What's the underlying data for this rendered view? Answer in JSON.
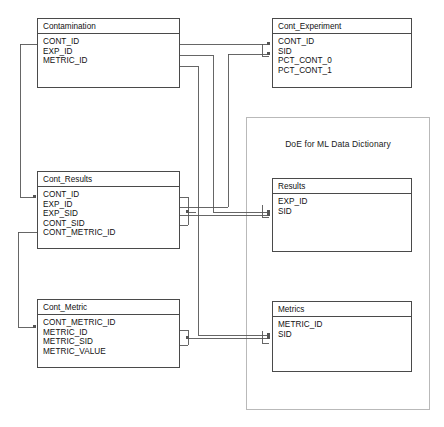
{
  "diagram": {
    "background_color": "#ffffff",
    "line_color": "#555555",
    "entity_border_color": "#4a4a4a",
    "group_border_color": "#b9b9b9"
  },
  "group": {
    "label": "DoE for ML Data Dictionary"
  },
  "entities": [
    {
      "key": "contamination",
      "name": "Contamination",
      "attributes": [
        "CONT_ID",
        "EXP_ID",
        "METRIC_ID"
      ]
    },
    {
      "key": "cont_experiment",
      "name": "Cont_Experiment",
      "attributes": [
        "CONT_ID",
        "SID",
        "PCT_CONT_0",
        "PCT_CONT_1"
      ]
    },
    {
      "key": "cont_results",
      "name": "Cont_Results",
      "attributes": [
        "CONT_ID",
        "EXP_ID",
        "EXP_SID",
        "CONT_SID",
        "CONT_METRIC_ID"
      ]
    },
    {
      "key": "results",
      "name": "Results",
      "attributes": [
        "EXP_ID",
        "SID"
      ]
    },
    {
      "key": "cont_metric",
      "name": "Cont_Metric",
      "attributes": [
        "CONT_METRIC_ID",
        "METRIC_ID",
        "METRIC_SID",
        "METRIC_VALUE"
      ]
    },
    {
      "key": "metrics",
      "name": "Metrics",
      "attributes": [
        "METRIC_ID",
        "SID"
      ]
    }
  ],
  "relationships": [
    {
      "from": "contamination",
      "to": "cont_experiment",
      "via": "CONT_ID"
    },
    {
      "from": "contamination",
      "to": "results",
      "via": "EXP_ID"
    },
    {
      "from": "contamination",
      "to": "metrics",
      "via": "METRIC_ID"
    },
    {
      "from": "contamination",
      "to": "cont_results",
      "via": "CONT_ID"
    },
    {
      "from": "cont_results",
      "to": "cont_experiment",
      "via": "CONT_SID"
    },
    {
      "from": "cont_results",
      "to": "results",
      "via": "EXP_SID"
    },
    {
      "from": "cont_results",
      "to": "cont_metric",
      "via": "CONT_METRIC_ID"
    },
    {
      "from": "cont_metric",
      "to": "metrics",
      "via": "METRIC_SID"
    }
  ]
}
